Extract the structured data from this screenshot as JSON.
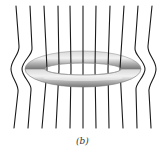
{
  "figure": {
    "caption": "(b)",
    "colors": {
      "background": "#ffffff",
      "field_line": "#1a1a1a",
      "ring_light": "#e6e6e6",
      "ring_mid": "#a8a8a8",
      "ring_dark": "#6e6e6e",
      "caption": "#333333"
    },
    "ring": {
      "cx": 83,
      "cy": 69,
      "outer_rx": 58,
      "outer_ry": 18,
      "inner_rx": 38,
      "inner_ry": 6
    },
    "field_lines": {
      "count": 11,
      "straight_top_x": [
        16,
        30,
        44,
        58,
        70,
        83,
        96,
        110,
        124,
        138,
        152
      ],
      "straight_bottom_x": [
        14,
        28,
        42,
        56,
        70,
        83,
        96,
        109,
        123,
        137,
        151
      ],
      "top_y": 6,
      "bottom_y": 128
    }
  }
}
